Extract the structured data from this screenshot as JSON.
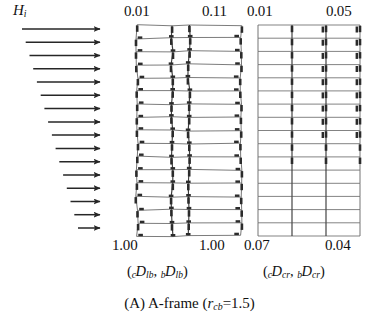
{
  "caption": {
    "text": "(A) A-frame (rcb=1.5)",
    "prefix": "(A) A-frame (",
    "symbol": "r",
    "symbol_sub": "cb",
    "suffix": "=1.5)"
  },
  "load": {
    "symbol": "H",
    "subscript": "i",
    "label": "Hi",
    "arrow_count": 16,
    "description": "lateral story forces, inverted-triangular distribution",
    "arrow_tip_x": 100,
    "arrow_tail_x_top": 22,
    "arrow_tail_x_bottom": 78
  },
  "panels": [
    {
      "id": "lb",
      "name": "left-frame-panel",
      "top_labels": {
        "left": "0.01",
        "right": "0.11"
      },
      "bottom_labels": {
        "left": "1.00",
        "right": "1.00"
      },
      "axis_label": {
        "text": "(cDlb, bDlb)",
        "open": "(",
        "terms": [
          {
            "pre": "c",
            "base": "D",
            "post": "lb"
          },
          {
            "pre": "b",
            "base": "D",
            "post": "lb"
          }
        ],
        "close": ")"
      },
      "geometry": {
        "bays": 3,
        "stories": 16,
        "x_left": 137,
        "x_right": 241,
        "y_top": 25,
        "y_bottom": 236,
        "column_x": [
          137,
          172,
          189,
          241
        ],
        "distorted": true
      },
      "hinges": {
        "description": "plastic hinges at nearly all beam ends and column ends over all stories",
        "beam_end_stories": [
          1,
          2,
          3,
          4,
          5,
          6,
          7,
          8,
          9,
          10,
          11,
          12,
          13,
          14,
          15,
          16
        ],
        "column_hinge_stories": [
          1,
          2,
          3,
          4,
          5,
          6,
          7,
          8,
          9,
          10,
          11,
          12,
          13,
          14,
          15,
          16
        ]
      }
    },
    {
      "id": "cr",
      "name": "right-frame-panel",
      "top_labels": {
        "left": "0.01",
        "right": "0.05"
      },
      "bottom_labels": {
        "left": "0.07",
        "right": "0.04"
      },
      "axis_label": {
        "text": "(cDcr, bDcr)",
        "open": "(",
        "terms": [
          {
            "pre": "c",
            "base": "D",
            "post": "cr"
          },
          {
            "pre": "b",
            "base": "D",
            "post": "cr"
          }
        ],
        "close": ")"
      },
      "geometry": {
        "bays": 3,
        "stories": 16,
        "x_left": 258,
        "x_right": 360,
        "y_top": 25,
        "y_bottom": 236,
        "column_x": [
          258,
          292,
          326,
          360
        ],
        "distorted": false
      },
      "hinges": {
        "description": "plastic hinges concentrated in upper stories only",
        "beam_end_stories": [
          1,
          2,
          3,
          4,
          5,
          6,
          7,
          8,
          9
        ],
        "column_hinge_stories": [
          1,
          2,
          3,
          4,
          5,
          6,
          7,
          8,
          9,
          10,
          11
        ]
      }
    }
  ],
  "colors": {
    "ink": "#1a1a1a",
    "frame_line": "#6d6d6d",
    "frame_line_dark": "#3c3c3c",
    "hinge": "#2b2b2b",
    "arrow": "#262626",
    "background": "#ffffff"
  }
}
